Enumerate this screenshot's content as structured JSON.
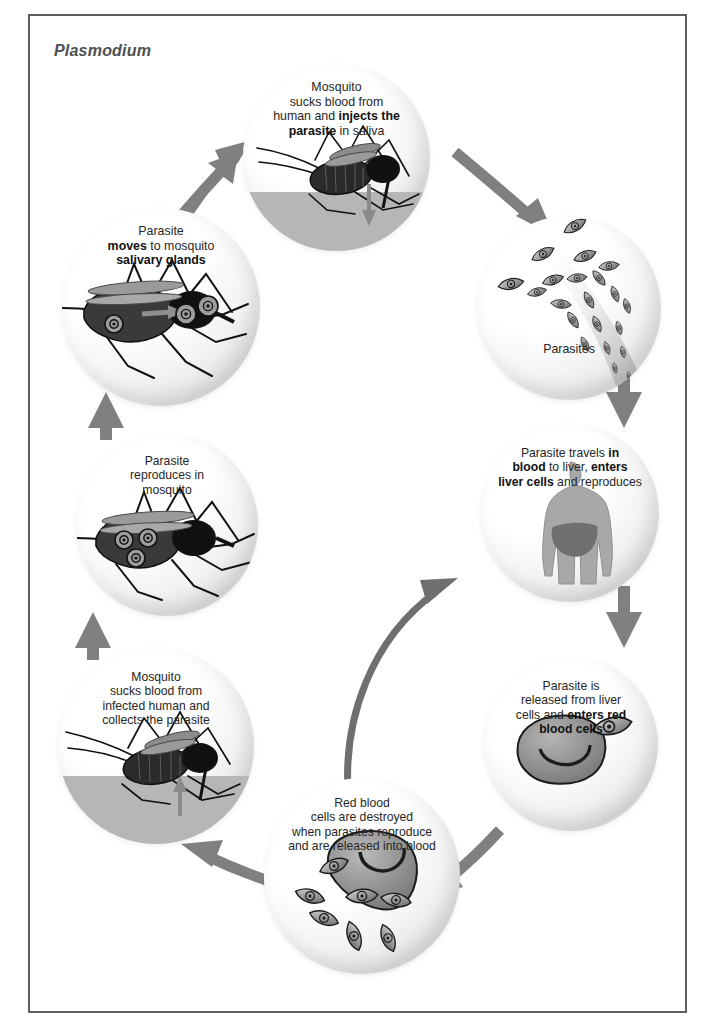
{
  "figure": {
    "title": "Plasmodium",
    "frame_color": "#5b5f61",
    "arrow_color": "#808080",
    "text_color": "#262626"
  },
  "stages": [
    {
      "id": "injects",
      "name": "mosquito-injects-parasite",
      "caption_html": "Mosquito<br>sucks blood from<br>human and <b>injects the<br>parasite</b> in saliva",
      "art": "mosquito-biting-human"
    },
    {
      "id": "parasites",
      "name": "parasites-in-blood",
      "caption_html": "Parasites",
      "art": "parasite-swarm"
    },
    {
      "id": "liver",
      "name": "parasite-enters-liver",
      "caption_html": "Parasite travels <b>in<br>blood</b> to liver, <b>enters<br>liver cells</b> and reproduces",
      "art": "human-body-liver"
    },
    {
      "id": "rbc",
      "name": "parasite-enters-red-blood-cells",
      "caption_html": "Parasite is<br>released from liver<br>cells and <b>enters red<br>blood cells</b>",
      "art": "red-blood-cell-with-parasite"
    },
    {
      "id": "destroyed",
      "name": "red-blood-cells-destroyed",
      "caption_html": "Red blood<br>cells are destroyed<br>when parasites reproduce<br>and are released into blood",
      "art": "bursting-red-blood-cell"
    },
    {
      "id": "collects",
      "name": "mosquito-collects-parasite",
      "caption_html": "Mosquito<br>sucks blood from<br>infected human and<br>collects the parasite",
      "art": "mosquito-feeding-on-infected-human"
    },
    {
      "id": "reproduces",
      "name": "parasite-reproduces-in-mosquito",
      "caption_html": "Parasite<br>reproduces in<br>mosquito",
      "art": "mosquito-with-parasites-in-abdomen"
    },
    {
      "id": "salivary",
      "name": "parasite-moves-to-salivary-glands",
      "caption_html": "Parasite<br><b>moves</b> to mosquito<br><b>salivary glands</b>",
      "art": "mosquito-parasites-moving-to-head"
    }
  ],
  "arrows": [
    {
      "name": "arrow-salivary-to-injects",
      "from": "salivary",
      "to": "injects"
    },
    {
      "name": "arrow-injects-to-parasites",
      "from": "injects",
      "to": "parasites"
    },
    {
      "name": "arrow-parasites-to-liver",
      "from": "parasites",
      "to": "liver"
    },
    {
      "name": "arrow-liver-to-rbc",
      "from": "liver",
      "to": "rbc"
    },
    {
      "name": "arrow-rbc-to-destroyed",
      "from": "rbc",
      "to": "destroyed"
    },
    {
      "name": "arrow-destroyed-to-liver",
      "from": "destroyed",
      "to": "liver"
    },
    {
      "name": "arrow-destroyed-to-collects",
      "from": "destroyed",
      "to": "collects"
    },
    {
      "name": "arrow-collects-to-reproduces",
      "from": "collects",
      "to": "reproduces"
    },
    {
      "name": "arrow-reproduces-to-salivary",
      "from": "reproduces",
      "to": "salivary"
    }
  ]
}
